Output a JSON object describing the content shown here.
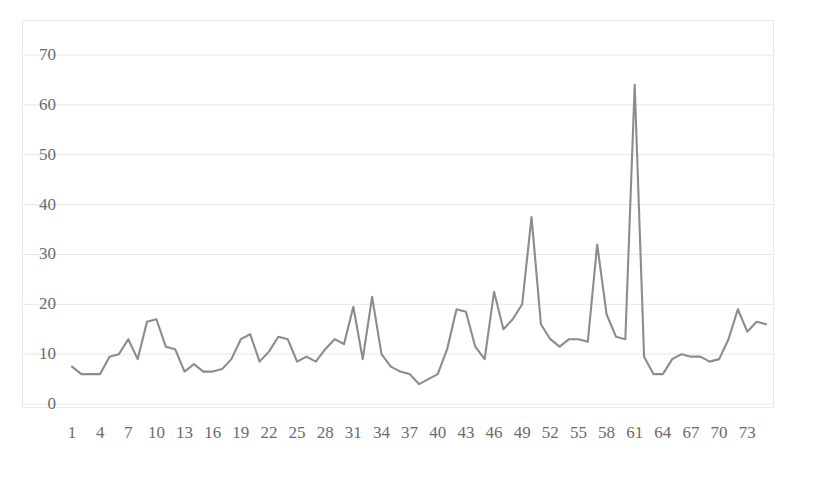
{
  "chart_data": {
    "type": "line",
    "title": "",
    "xlabel": "",
    "ylabel": "",
    "xlim": [
      1,
      75
    ],
    "ylim": [
      0,
      70
    ],
    "grid": true,
    "legend": null,
    "series_color": "#8c8c8c",
    "gridline_color": "#e6e6e6",
    "axis_text_color": "#6b6b6b",
    "y_ticks": [
      0,
      10,
      20,
      30,
      40,
      50,
      60,
      70
    ],
    "y_tick_labels": [
      "0",
      "10",
      "20",
      "30",
      "40",
      "50",
      "60",
      "70"
    ],
    "x_ticks": [
      1,
      4,
      7,
      10,
      13,
      16,
      19,
      22,
      25,
      28,
      31,
      34,
      37,
      40,
      43,
      46,
      49,
      52,
      55,
      58,
      61,
      64,
      67,
      70,
      73
    ],
    "x_tick_labels": [
      "1",
      "4",
      "7",
      "10",
      "13",
      "16",
      "19",
      "22",
      "25",
      "28",
      "31",
      "34",
      "37",
      "40",
      "43",
      "46",
      "49",
      "52",
      "55",
      "58",
      "61",
      "64",
      "67",
      "70",
      "73"
    ],
    "x": [
      1,
      2,
      3,
      4,
      5,
      6,
      7,
      8,
      9,
      10,
      11,
      12,
      13,
      14,
      15,
      16,
      17,
      18,
      19,
      20,
      21,
      22,
      23,
      24,
      25,
      26,
      27,
      28,
      29,
      30,
      31,
      32,
      33,
      34,
      35,
      36,
      37,
      38,
      39,
      40,
      41,
      42,
      43,
      44,
      45,
      46,
      47,
      48,
      49,
      50,
      51,
      52,
      53,
      54,
      55,
      56,
      57,
      58,
      59,
      60,
      61,
      62,
      63,
      64,
      65,
      66,
      67,
      68,
      69,
      70,
      71,
      72,
      73,
      74,
      75
    ],
    "values": [
      7.5,
      6.0,
      6.0,
      6.0,
      9.5,
      10.0,
      13.0,
      9.0,
      16.5,
      17.0,
      11.5,
      11.0,
      6.5,
      8.0,
      6.5,
      6.5,
      7.0,
      9.0,
      13.0,
      14.0,
      8.5,
      10.5,
      13.5,
      13.0,
      8.5,
      9.5,
      8.5,
      11.0,
      13.0,
      12.0,
      19.5,
      9.0,
      21.5,
      10.0,
      7.5,
      6.5,
      6.0,
      4.0,
      5.0,
      6.0,
      11.0,
      19.0,
      18.5,
      11.5,
      9.0,
      22.5,
      15.0,
      17.0,
      20.0,
      37.5,
      16.0,
      13.0,
      11.5,
      13.0,
      13.0,
      12.5,
      32.0,
      18.0,
      13.5,
      13.0,
      64.0,
      9.5,
      6.0,
      6.0,
      9.0,
      10.0,
      9.5,
      9.5,
      8.5,
      9.0,
      13.0,
      19.0,
      14.5,
      16.5,
      16.0
    ]
  },
  "axes": {
    "y_axis_name": "value-axis",
    "x_axis_name": "index-axis"
  }
}
